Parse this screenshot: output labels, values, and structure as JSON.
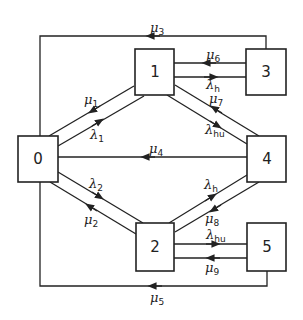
{
  "diagram": {
    "type": "state-transition",
    "states": [
      {
        "id": "0",
        "label": "0"
      },
      {
        "id": "1",
        "label": "1"
      },
      {
        "id": "2",
        "label": "2"
      },
      {
        "id": "3",
        "label": "3"
      },
      {
        "id": "4",
        "label": "4"
      },
      {
        "id": "5",
        "label": "5"
      }
    ],
    "transitions": [
      {
        "from": "0",
        "to": "1",
        "sym": "λ",
        "sub": "1"
      },
      {
        "from": "1",
        "to": "0",
        "sym": "μ",
        "sub": "1"
      },
      {
        "from": "0",
        "to": "2",
        "sym": "λ",
        "sub": "2"
      },
      {
        "from": "2",
        "to": "0",
        "sym": "μ",
        "sub": "2"
      },
      {
        "from": "3",
        "to": "0",
        "sym": "μ",
        "sub": "3"
      },
      {
        "from": "4",
        "to": "0",
        "sym": "μ",
        "sub": "4"
      },
      {
        "from": "5",
        "to": "0",
        "sym": "μ",
        "sub": "5"
      },
      {
        "from": "3",
        "to": "1",
        "sym": "μ",
        "sub": "6"
      },
      {
        "from": "1",
        "to": "3",
        "sym": "λ",
        "sub": "h"
      },
      {
        "from": "4",
        "to": "1",
        "sym": "μ",
        "sub": "7"
      },
      {
        "from": "1",
        "to": "4",
        "sym": "λ",
        "sub": "hu"
      },
      {
        "from": "2",
        "to": "4",
        "sym": "λ",
        "sub": "h"
      },
      {
        "from": "4",
        "to": "2",
        "sym": "μ",
        "sub": "8"
      },
      {
        "from": "2",
        "to": "5",
        "sym": "λ",
        "sub": "hu"
      },
      {
        "from": "5",
        "to": "2",
        "sym": "μ",
        "sub": "9"
      }
    ]
  },
  "labels": {
    "mu1": {
      "sym": "μ",
      "sub": "1"
    },
    "lambda1": {
      "sym": "λ",
      "sub": "1"
    },
    "lambda2": {
      "sym": "λ",
      "sub": "2"
    },
    "mu2": {
      "sym": "μ",
      "sub": "2"
    },
    "mu3": {
      "sym": "μ",
      "sub": "3"
    },
    "mu4": {
      "sym": "μ",
      "sub": "4"
    },
    "mu5": {
      "sym": "μ",
      "sub": "5"
    },
    "mu6": {
      "sym": "μ",
      "sub": "6"
    },
    "lambdah_13": {
      "sym": "λ",
      "sub": "h"
    },
    "mu7": {
      "sym": "μ",
      "sub": "7"
    },
    "lambdahu_14": {
      "sym": "λ",
      "sub": "hu"
    },
    "lambdah_24": {
      "sym": "λ",
      "sub": "h"
    },
    "mu8": {
      "sym": "μ",
      "sub": "8"
    },
    "lambdahu_25": {
      "sym": "λ",
      "sub": "hu"
    },
    "mu9": {
      "sym": "μ",
      "sub": "9"
    }
  },
  "boxes": {
    "b0": "0",
    "b1": "1",
    "b2": "2",
    "b3": "3",
    "b4": "4",
    "b5": "5"
  }
}
